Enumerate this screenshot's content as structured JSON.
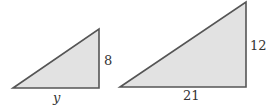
{
  "diagram": {
    "colors": {
      "fill": "#e2e2e2",
      "stroke": "#555555",
      "text": "#333333"
    },
    "triangles": [
      {
        "name": "small",
        "points": [
          [
            13,
            88
          ],
          [
            99,
            29
          ],
          [
            99,
            88
          ]
        ],
        "labels": {
          "height": "8",
          "base": "y"
        }
      },
      {
        "name": "large",
        "points": [
          [
            120,
            87
          ],
          [
            246,
            2
          ],
          [
            246,
            87
          ]
        ],
        "labels": {
          "height": "12",
          "base": "21"
        }
      }
    ]
  }
}
